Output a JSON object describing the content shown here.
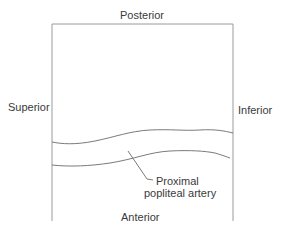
{
  "diagram": {
    "labels": {
      "top": "Posterior",
      "left": "Superior",
      "right": "Inferior",
      "bottom": "Anterior"
    },
    "annotation": {
      "line1": "Proximal",
      "line2": "popliteal artery"
    },
    "colors": {
      "frame": "#9a9a9a",
      "vessel": "#7a7a7a",
      "text": "#3a3a3a"
    }
  }
}
